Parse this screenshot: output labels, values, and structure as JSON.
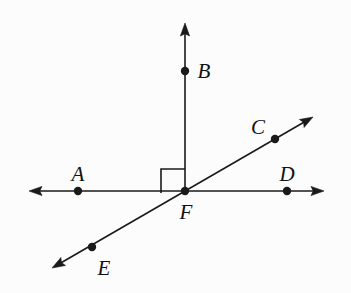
{
  "figure": {
    "kind": "geometry-diagram",
    "width": 351,
    "height": 293,
    "background_color": "#fcfcfc",
    "stroke_color": "#1a1a1a",
    "stroke_width": 1.6,
    "dot_radius": 4.2,
    "label_font_size": 21,
    "label_style": "italic-serif"
  },
  "points": [
    {
      "name": "A",
      "x": 78,
      "y": 191,
      "label_x": 78,
      "label_y": 174
    },
    {
      "name": "B",
      "x": 185,
      "y": 71,
      "label_x": 204,
      "label_y": 71
    },
    {
      "name": "C",
      "x": 275,
      "y": 139,
      "label_x": 258,
      "label_y": 127
    },
    {
      "name": "D",
      "x": 287,
      "y": 191,
      "label_x": 287,
      "label_y": 174
    },
    {
      "name": "E",
      "x": 92,
      "y": 247,
      "label_x": 104,
      "label_y": 268
    },
    {
      "name": "F",
      "x": 185,
      "y": 191,
      "label_x": 186,
      "label_y": 212
    }
  ],
  "lines": [
    {
      "name": "line-AD",
      "description": "horizontal line through A, F and D with arrowheads on both ends",
      "x1": 29,
      "y1": 191,
      "x2": 324,
      "y2": 191,
      "arrow_start": true,
      "arrow_end": true
    },
    {
      "name": "line-EC",
      "description": "diagonal line through E, F and C with arrowheads on both ends",
      "x1": 52,
      "y1": 268,
      "x2": 313,
      "y2": 117,
      "arrow_start": true,
      "arrow_end": true
    },
    {
      "name": "ray-FB",
      "description": "vertical ray from F upward through B with one arrowhead",
      "x1": 185,
      "y1": 191,
      "x2": 185,
      "y2": 23,
      "arrow_start": false,
      "arrow_end": true
    }
  ],
  "right_angle_marker": {
    "name": "right-angle-square",
    "description": "square marker between ray FB and ray FA indicating 90 degrees",
    "x": 161,
    "y": 169,
    "size": 24,
    "measure": "90"
  },
  "arrowhead": {
    "length": 13,
    "half_width": 4.6
  }
}
